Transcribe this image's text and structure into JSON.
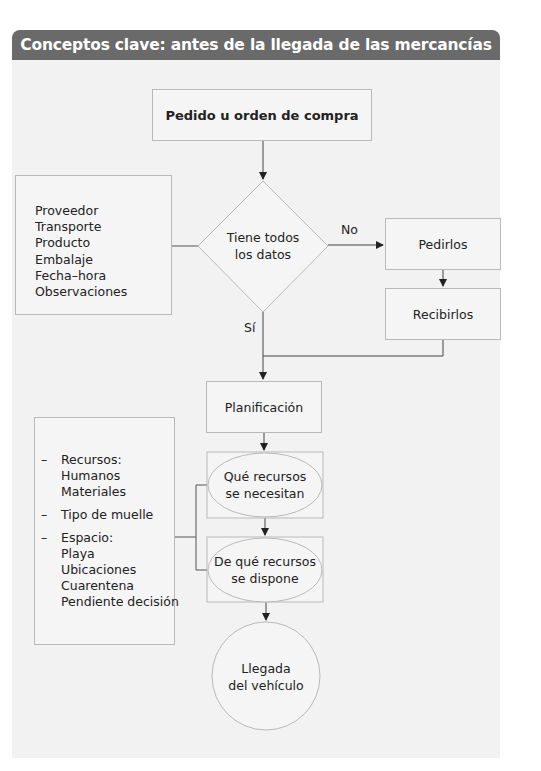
{
  "header": {
    "title": "Conceptos clave: antes de la llegada de las mercancías"
  },
  "colors": {
    "header_bg": "#6a6a6a",
    "panel_bg": "#f2f2f2",
    "box_border": "#b9b9b9",
    "line": "#333333"
  },
  "nodes": {
    "order": {
      "label": "Pedido u orden de compra",
      "shape": "rectangle"
    },
    "decision": {
      "line1": "Tiene todos",
      "line2": "los datos",
      "shape": "diamond"
    },
    "request": {
      "label": "Pedirlos",
      "shape": "rectangle"
    },
    "receive": {
      "label": "Recibirlos",
      "shape": "rectangle"
    },
    "planning": {
      "label": "Planificación",
      "shape": "rectangle"
    },
    "needed": {
      "line1": "Qué recursos",
      "line2": "se necesitan",
      "shape": "ellipse-in-rectangle"
    },
    "available": {
      "line1": "De qué recursos",
      "line2": "se dispone",
      "shape": "ellipse-in-rectangle"
    },
    "arrival": {
      "line1": "Llegada",
      "line2": "del vehículo",
      "shape": "circle"
    }
  },
  "edge_labels": {
    "no": "No",
    "yes": "Sí"
  },
  "data_list": {
    "items": [
      "Proveedor",
      "Transporte",
      "Producto",
      "Embalaje",
      "Fecha–hora",
      "Observaciones"
    ]
  },
  "resources_list": {
    "groups": [
      {
        "title": "Recursos:",
        "items": [
          "Humanos",
          "Materiales"
        ]
      },
      {
        "title": "Tipo de muelle",
        "items": []
      },
      {
        "title": "Espacio:",
        "items": [
          "Playa",
          "Ubicaciones",
          "Cuarentena",
          "Pendiente decisión"
        ]
      }
    ],
    "bullet": "–"
  }
}
